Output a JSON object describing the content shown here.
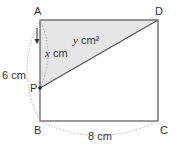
{
  "diagram": {
    "type": "geometry-rectangle",
    "points": {
      "A": {
        "label": "A"
      },
      "B": {
        "label": "B"
      },
      "C": {
        "label": "C"
      },
      "D": {
        "label": "D"
      },
      "P": {
        "label": "P"
      }
    },
    "dimensions": {
      "AB": "6 cm",
      "BC": "8 cm"
    },
    "variables": {
      "AP_var": "x",
      "AP_unit": " cm",
      "area_var": "y",
      "area_unit": " cm²"
    },
    "colors": {
      "shade": "#e6e6e6",
      "stroke": "#555555",
      "dashed": "#aaaaaa",
      "text": "#333333"
    }
  }
}
